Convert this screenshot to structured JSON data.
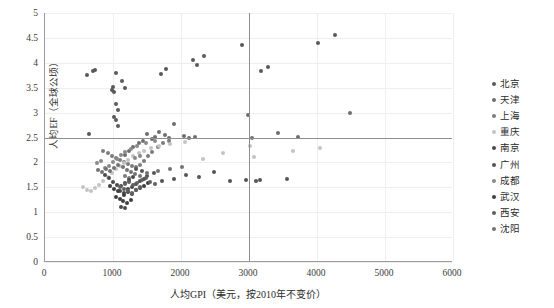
{
  "chart_data": {
    "type": "scatter",
    "title": "",
    "xlabel": "人均GPI（美元，按2010年不变价）",
    "ylabel": "人均EF（全球公顷）",
    "xlim": [
      0,
      6000
    ],
    "ylim": [
      0,
      5
    ],
    "xticks": [
      0,
      1000,
      2000,
      3000,
      4000,
      5000,
      6000
    ],
    "yticks": [
      0,
      0.5,
      1,
      1.5,
      2,
      2.5,
      3,
      3.5,
      4,
      4.5,
      5
    ],
    "grid": true,
    "legend_position": "right",
    "reference_lines": [
      {
        "axis": "y",
        "value": 2.5,
        "color": "#8d8d92"
      },
      {
        "axis": "x",
        "value": 3000,
        "color": "#8d8d92"
      }
    ],
    "series": [
      {
        "name": "北京",
        "color": "#595959",
        "points": [
          [
            620,
            3.75
          ],
          [
            700,
            3.83
          ],
          [
            730,
            3.86
          ],
          [
            1050,
            3.79
          ],
          [
            1130,
            3.64
          ],
          [
            1180,
            3.5
          ],
          [
            1000,
            3.52
          ],
          [
            990,
            3.46
          ],
          [
            1010,
            3.42
          ],
          [
            1050,
            3.17
          ],
          [
            1080,
            3.05
          ],
          [
            1020,
            2.92
          ],
          [
            1040,
            2.86
          ],
          [
            1070,
            2.74
          ],
          [
            1700,
            3.77
          ],
          [
            1780,
            3.87
          ],
          [
            2180,
            4.05
          ],
          [
            2230,
            3.95
          ],
          [
            2340,
            4.14
          ],
          [
            2900,
            4.35
          ],
          [
            3180,
            3.83
          ],
          [
            3280,
            3.92
          ],
          [
            4270,
            4.55
          ],
          [
            4020,
            4.4
          ],
          [
            640,
            2.57
          ]
        ]
      },
      {
        "name": "天津",
        "color": "#6e6e6e",
        "points": [
          [
            1500,
            2.58
          ],
          [
            1570,
            2.46
          ],
          [
            1620,
            2.52
          ],
          [
            1680,
            2.62
          ],
          [
            1760,
            2.55
          ],
          [
            1830,
            2.48
          ],
          [
            1900,
            2.78
          ],
          [
            2040,
            2.54
          ],
          [
            2120,
            2.5
          ],
          [
            2210,
            2.52
          ],
          [
            2980,
            2.95
          ],
          [
            3050,
            2.5
          ],
          [
            3420,
            2.6
          ],
          [
            3720,
            2.52
          ],
          [
            4490,
            3.0
          ],
          [
            1380,
            2.38
          ],
          [
            1440,
            2.42
          ],
          [
            1290,
            2.3
          ],
          [
            1230,
            2.22
          ],
          [
            1180,
            2.15
          ]
        ]
      },
      {
        "name": "上海",
        "color": "#7d7d7d",
        "points": [
          [
            860,
            2.22
          ],
          [
            920,
            2.18
          ],
          [
            980,
            2.12
          ],
          [
            1040,
            2.08
          ],
          [
            1100,
            2.05
          ],
          [
            1160,
            2.0
          ],
          [
            1220,
            1.96
          ],
          [
            1280,
            1.92
          ],
          [
            1340,
            1.9
          ],
          [
            1400,
            1.95
          ],
          [
            1460,
            2.02
          ],
          [
            1520,
            2.12
          ],
          [
            1580,
            2.2
          ],
          [
            1660,
            2.3
          ],
          [
            1740,
            2.38
          ],
          [
            1820,
            2.42
          ],
          [
            1180,
            1.72
          ],
          [
            1240,
            1.68
          ]
        ]
      },
      {
        "name": "重庆",
        "color": "#c3c3c3",
        "points": [
          [
            560,
            1.5
          ],
          [
            620,
            1.45
          ],
          [
            680,
            1.42
          ],
          [
            740,
            1.48
          ],
          [
            800,
            1.55
          ],
          [
            860,
            1.62
          ],
          [
            920,
            1.7
          ],
          [
            980,
            1.78
          ],
          [
            1040,
            1.86
          ],
          [
            1100,
            1.92
          ],
          [
            1160,
            1.98
          ],
          [
            1220,
            2.05
          ],
          [
            1300,
            2.12
          ],
          [
            1380,
            2.18
          ],
          [
            1460,
            2.22
          ],
          [
            1560,
            2.28
          ],
          [
            1680,
            2.32
          ],
          [
            1840,
            2.36
          ],
          [
            2060,
            2.4
          ],
          [
            2320,
            2.06
          ],
          [
            2620,
            2.18
          ],
          [
            3020,
            2.32
          ],
          [
            3080,
            2.1
          ],
          [
            3640,
            2.22
          ],
          [
            4040,
            2.28
          ]
        ]
      },
      {
        "name": "南京",
        "color": "#4a4a4a",
        "points": [
          [
            1000,
            1.6
          ],
          [
            1060,
            1.55
          ],
          [
            1120,
            1.52
          ],
          [
            1180,
            1.58
          ],
          [
            1240,
            1.64
          ],
          [
            1300,
            1.7
          ],
          [
            1100,
            1.42
          ],
          [
            1160,
            1.38
          ],
          [
            1220,
            1.46
          ],
          [
            1280,
            1.5
          ],
          [
            1340,
            1.56
          ],
          [
            1400,
            1.62
          ],
          [
            1460,
            1.66
          ],
          [
            1120,
            1.1
          ],
          [
            1180,
            1.08
          ],
          [
            940,
            1.68
          ],
          [
            880,
            1.74
          ]
        ]
      },
      {
        "name": "广州",
        "color": "#555555",
        "points": [
          [
            1500,
            1.72
          ],
          [
            1600,
            1.78
          ],
          [
            1720,
            1.62
          ],
          [
            1900,
            1.66
          ],
          [
            2080,
            1.74
          ],
          [
            2260,
            1.7
          ],
          [
            2480,
            1.8
          ],
          [
            2720,
            1.62
          ],
          [
            2960,
            1.64
          ],
          [
            3100,
            1.62
          ],
          [
            3160,
            1.64
          ],
          [
            3560,
            1.66
          ],
          [
            1420,
            1.82
          ],
          [
            1340,
            1.86
          ]
        ]
      },
      {
        "name": "成都",
        "color": "#8a8a8a",
        "points": [
          [
            760,
            1.98
          ],
          [
            820,
            2.02
          ],
          [
            880,
            1.88
          ],
          [
            940,
            1.92
          ],
          [
            1000,
            2.0
          ],
          [
            1060,
            2.06
          ],
          [
            1120,
            2.14
          ],
          [
            1180,
            2.2
          ],
          [
            1260,
            2.26
          ],
          [
            1360,
            2.32
          ],
          [
            1480,
            2.38
          ],
          [
            1620,
            2.42
          ],
          [
            1320,
            2.08
          ],
          [
            1400,
            2.12
          ]
        ]
      },
      {
        "name": "武汉",
        "color": "#3f3f3f",
        "points": [
          [
            1040,
            1.3
          ],
          [
            1100,
            1.26
          ],
          [
            1160,
            1.34
          ],
          [
            1220,
            1.4
          ],
          [
            1280,
            1.36
          ],
          [
            1340,
            1.44
          ],
          [
            1400,
            1.48
          ],
          [
            1460,
            1.52
          ],
          [
            1140,
            1.22
          ],
          [
            1200,
            1.18
          ],
          [
            1260,
            1.24
          ],
          [
            1080,
            1.42
          ],
          [
            1020,
            1.46
          ],
          [
            960,
            1.52
          ],
          [
            1520,
            1.58
          ]
        ]
      },
      {
        "name": "西安",
        "color": "#606060",
        "points": [
          [
            1160,
            1.46
          ],
          [
            1220,
            1.42
          ],
          [
            1280,
            1.38
          ],
          [
            1340,
            1.44
          ],
          [
            1400,
            1.5
          ],
          [
            1180,
            1.56
          ],
          [
            1240,
            1.6
          ],
          [
            1300,
            1.54
          ],
          [
            1360,
            1.58
          ],
          [
            1100,
            1.5
          ],
          [
            1420,
            1.64
          ],
          [
            1480,
            1.68
          ],
          [
            1540,
            1.6
          ],
          [
            1620,
            1.56
          ]
        ]
      },
      {
        "name": "沈阳",
        "color": "#737373",
        "points": [
          [
            780,
            1.84
          ],
          [
            840,
            1.8
          ],
          [
            900,
            1.86
          ],
          [
            960,
            1.82
          ],
          [
            1020,
            1.88
          ],
          [
            1080,
            1.94
          ],
          [
            1140,
            1.9
          ],
          [
            1200,
            1.84
          ],
          [
            1260,
            1.8
          ],
          [
            1320,
            1.76
          ],
          [
            1400,
            1.72
          ],
          [
            1500,
            1.78
          ],
          [
            1660,
            1.82
          ],
          [
            1840,
            1.86
          ],
          [
            2020,
            1.9
          ]
        ]
      }
    ]
  }
}
